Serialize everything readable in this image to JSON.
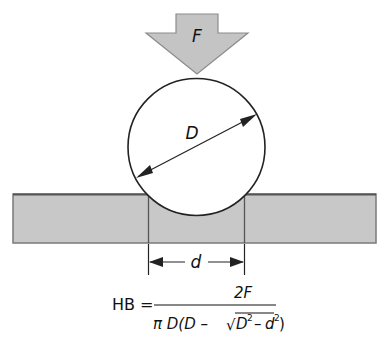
{
  "diagram": {
    "force_label": "F",
    "ball_diameter_label": "D",
    "indent_diameter_label": "d",
    "colors": {
      "arrow_fill": "#c4c4c4",
      "arrow_stroke": "#8c8c8c",
      "plate_fill": "#c8c8c8",
      "plate_stroke": "#6e6e6e",
      "ball_fill": "#ffffff",
      "ball_stroke": "#222222",
      "line": "#222222"
    }
  },
  "formula": {
    "lhs": "HB =",
    "numerator": "2F",
    "denominator_prefix": "π D(D –",
    "sqrt_symbol": "√",
    "radicand_D": "D",
    "exp1": "2",
    "minus": "–",
    "radicand_d": "d",
    "exp2": "2",
    "close_paren": ")"
  }
}
